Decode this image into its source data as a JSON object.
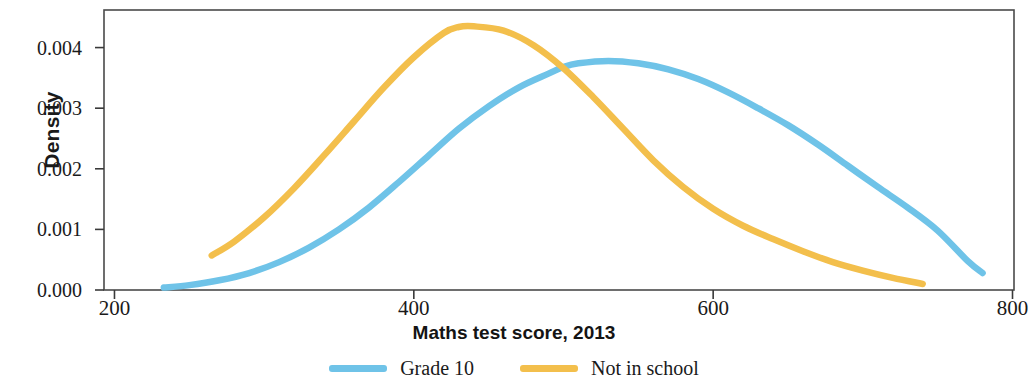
{
  "chart_data": {
    "type": "line",
    "title": "",
    "xlabel": "Maths test score, 2013",
    "ylabel": "Density",
    "xlim": [
      193,
      801
    ],
    "ylim": [
      0,
      0.00462
    ],
    "xticks": [
      200,
      400,
      600,
      800
    ],
    "xtick_labels": [
      "200",
      "400",
      "600",
      "800"
    ],
    "yticks": [
      0.0,
      0.001,
      0.002,
      0.003,
      0.004
    ],
    "ytick_labels": [
      "0.000",
      "0.001",
      "0.002",
      "0.003",
      "0.004"
    ],
    "grid": false,
    "legend_position": "bottom",
    "series": [
      {
        "name": "Grade 10",
        "color": "#6FC3E8",
        "x": [
          233,
          250,
          270,
          290,
          310,
          330,
          350,
          370,
          390,
          410,
          430,
          450,
          470,
          490,
          500,
          510,
          530,
          550,
          570,
          590,
          610,
          630,
          650,
          670,
          690,
          710,
          730,
          750,
          770,
          780
        ],
        "y": [
          4e-05,
          8e-05,
          0.00016,
          0.00028,
          0.00046,
          0.0007,
          0.001,
          0.00136,
          0.00178,
          0.00222,
          0.00266,
          0.00303,
          0.00334,
          0.00357,
          0.00368,
          0.00374,
          0.00378,
          0.00374,
          0.00364,
          0.00348,
          0.00326,
          0.003,
          0.00272,
          0.0024,
          0.00205,
          0.0017,
          0.00136,
          0.00098,
          0.00048,
          0.00028
        ]
      },
      {
        "name": "Not in school",
        "color": "#F3BF4C",
        "x": [
          265,
          280,
          300,
          320,
          340,
          360,
          380,
          400,
          420,
          430,
          440,
          460,
          480,
          500,
          520,
          540,
          560,
          580,
          600,
          620,
          640,
          660,
          680,
          700,
          720,
          740
        ],
        "y": [
          0.00057,
          0.0008,
          0.0012,
          0.00168,
          0.00222,
          0.00278,
          0.00334,
          0.00384,
          0.00424,
          0.00434,
          0.00435,
          0.00428,
          0.00404,
          0.00366,
          0.00318,
          0.00266,
          0.00214,
          0.0017,
          0.00134,
          0.00106,
          0.00084,
          0.00064,
          0.00046,
          0.00032,
          0.0002,
          0.0001
        ]
      }
    ]
  },
  "legend": {
    "items": [
      {
        "label": "Grade 10",
        "color": "#6FC3E8"
      },
      {
        "label": "Not in school",
        "color": "#F3BF4C"
      }
    ]
  }
}
